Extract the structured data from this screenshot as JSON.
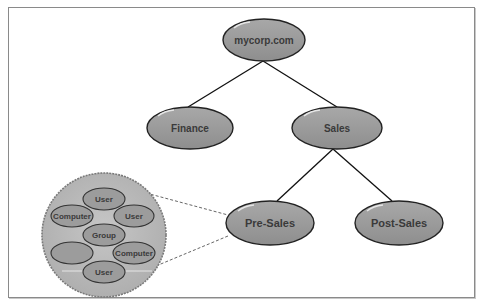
{
  "diagram": {
    "colors": {
      "node_fill": "#9a9a9a",
      "node_stroke": "#222222",
      "container_fill": "#bdbdbd",
      "container_stroke": "#808080",
      "edge": "#111111",
      "zoom_line": "#555555"
    },
    "nodes": {
      "root": {
        "label": "mycorp.com"
      },
      "finance": {
        "label": "Finance"
      },
      "sales": {
        "label": "Sales"
      },
      "presales": {
        "label": "Pre-Sales"
      },
      "postsales": {
        "label": "Post-Sales"
      }
    },
    "edges": [
      {
        "from": "mycorp.com",
        "to": "Finance"
      },
      {
        "from": "mycorp.com",
        "to": "Sales"
      },
      {
        "from": "Sales",
        "to": "Pre-Sales"
      },
      {
        "from": "Sales",
        "to": "Post-Sales"
      }
    ],
    "detail": {
      "expands": "Pre-Sales",
      "objects": [
        {
          "label": "User"
        },
        {
          "label": "Computer"
        },
        {
          "label": "User"
        },
        {
          "label": "Group"
        },
        {
          "label": ""
        },
        {
          "label": "Computer"
        },
        {
          "label": "User"
        }
      ]
    }
  }
}
